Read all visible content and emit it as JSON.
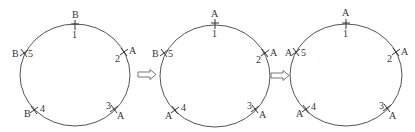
{
  "diagram": {
    "type": "ring-state-sequence",
    "stages": [
      {
        "center": [
          75,
          75
        ],
        "rx": 55,
        "ry": 51,
        "nodes": [
          {
            "number": "1",
            "state": "B"
          },
          {
            "number": "2",
            "state": "A"
          },
          {
            "number": "3",
            "state": "A"
          },
          {
            "number": "4",
            "state": "B"
          },
          {
            "number": "5",
            "state": "B"
          }
        ]
      },
      {
        "center": [
          215,
          76
        ],
        "rx": 55,
        "ry": 51,
        "nodes": [
          {
            "number": "1",
            "state": "A"
          },
          {
            "number": "2",
            "state": "A"
          },
          {
            "number": "3",
            "state": "A"
          },
          {
            "number": "4",
            "state": "A"
          },
          {
            "number": "5",
            "state": "B"
          }
        ]
      },
      {
        "center": [
          346,
          75
        ],
        "rx": 56,
        "ry": 51,
        "nodes": [
          {
            "number": "1",
            "state": "A"
          },
          {
            "number": "2",
            "state": "A"
          },
          {
            "number": "3",
            "state": "A"
          },
          {
            "number": "4",
            "state": "A"
          },
          {
            "number": "5",
            "state": "A"
          }
        ]
      }
    ],
    "arrows": [
      {
        "from": 1,
        "to": 2,
        "style": "hollow-right-arrow"
      },
      {
        "from": 2,
        "to": 3,
        "style": "hollow-right-arrow"
      }
    ],
    "colors": {
      "line": "#555555",
      "text": "#333333",
      "background": "#ffffff"
    }
  }
}
